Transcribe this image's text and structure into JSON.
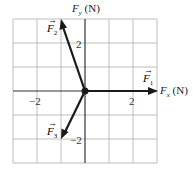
{
  "diagram": {
    "type": "force-vector-diagram",
    "x_axis": {
      "label_var": "F",
      "label_sub": "x",
      "label_unit": "(N)"
    },
    "y_axis": {
      "label_var": "F",
      "label_sub": "y",
      "label_unit": "(N)"
    },
    "ticks": {
      "x_neg": "−2",
      "x_pos": "2",
      "y_pos": "2",
      "y_neg": "−2"
    },
    "grid": {
      "x_range": [
        -3,
        3
      ],
      "y_range": [
        -3,
        3
      ],
      "step": 1
    },
    "vectors": [
      {
        "name": "F",
        "sub": "1",
        "x": 3,
        "y": 0
      },
      {
        "name": "F",
        "sub": "2",
        "x": -1,
        "y": 3
      },
      {
        "name": "F",
        "sub": "3",
        "x": -1,
        "y": -2
      }
    ],
    "colors": {
      "grid": "#b5b5b5",
      "vector": "#1a1a1a"
    }
  }
}
